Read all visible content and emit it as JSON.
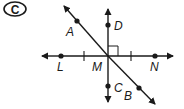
{
  "figure": {
    "badge": "C",
    "colors": {
      "line": "#1a1a1a",
      "background": "#ffffff"
    },
    "lines": [
      {
        "name": "horizontal-line-LN",
        "points": [
          "L",
          "M",
          "N"
        ],
        "arrows": "both"
      },
      {
        "name": "vertical-line-DC",
        "points": [
          "D",
          "M",
          "C"
        ],
        "arrows": "both"
      },
      {
        "name": "diagonal-line-AB",
        "points": [
          "A",
          "M",
          "B"
        ],
        "arrows": "both"
      }
    ],
    "points": {
      "A": {
        "label": "A"
      },
      "B": {
        "label": "B"
      },
      "C": {
        "label": "C"
      },
      "D": {
        "label": "D"
      },
      "L": {
        "label": "L"
      },
      "M": {
        "label": "M"
      },
      "N": {
        "label": "N"
      }
    },
    "annotations": {
      "right_angle": "angle DMN",
      "congruence_ticks": [
        "LM",
        "MN"
      ]
    }
  }
}
